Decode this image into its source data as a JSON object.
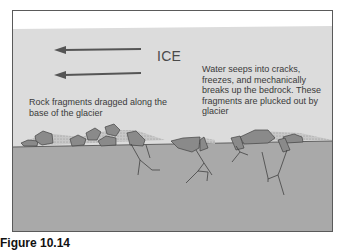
{
  "diagram": {
    "title_label": "ICE",
    "left_annotation": "Rock fragments dragged along the base of the glacier",
    "right_annotation": "Water seeps into cracks, freezes, and mechanically breaks up the bedrock. These fragments are plucked out by glacier",
    "caption": "Figure 10.14",
    "arrows": [
      {
        "direction": "left",
        "label": "ice-flow-direction"
      },
      {
        "direction": "left",
        "label": "ice-flow-direction"
      }
    ],
    "colors": {
      "sky": "#ffffff",
      "ice": "#dcdcdc",
      "bedrock": "#a9a9a9",
      "rock": "#8a8a8a",
      "arrow": "#555555",
      "outline": "#444444"
    }
  }
}
